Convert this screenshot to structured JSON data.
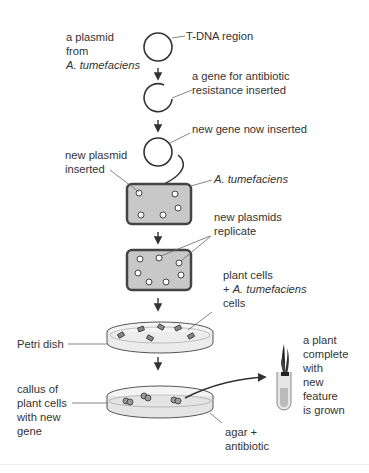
{
  "diagram": {
    "colors": {
      "stroke": "#333333",
      "cell_fill": "#c8c8c8",
      "cell_border": "#444444",
      "dish_fill": "#f0f0f0",
      "text": "#333333"
    },
    "labels": {
      "plasmid_from_line1": "a plasmid",
      "plasmid_from_line2": "from",
      "plasmid_from_line3": "A. tumefaciens",
      "tdna_region": "T-DNA region",
      "antibiotic_gene_line1": "a gene for antibiotic",
      "antibiotic_gene_line2": "resistance inserted",
      "new_gene": "new gene now inserted",
      "new_plasmid_line1": "new plasmid",
      "new_plasmid_line2": "inserted",
      "a_tumefaciens": "A. tumefaciens",
      "replicate_line1": "new plasmids",
      "replicate_line2": "replicate",
      "plant_cells_line1": "plant cells",
      "plant_cells_line2_prefix": "+ ",
      "plant_cells_line2_italic": "A. tumefaciens",
      "plant_cells_line3": "cells",
      "petri_dish": "Petri dish",
      "callus_line1": "callus of",
      "callus_line2": "plant cells",
      "callus_line3": "with new",
      "callus_line4": "gene",
      "agar_line1": "agar +",
      "agar_line2": "antibiotic",
      "plant_line1": "a plant",
      "plant_line2": "complete",
      "plant_line3": "with",
      "plant_line4": "new",
      "plant_line5": "feature",
      "plant_line6": "is grown"
    },
    "steps": [
      "plasmid",
      "plasmid cut with antibiotic resistance gene",
      "plasmid with new gene",
      "A. tumefaciens cell with new plasmid",
      "A. tumefaciens cell with replicated plasmids",
      "Petri dish with plant cells + A. tumefaciens",
      "Petri dish with callus on agar + antibiotic",
      "test tube with grown plant"
    ]
  }
}
